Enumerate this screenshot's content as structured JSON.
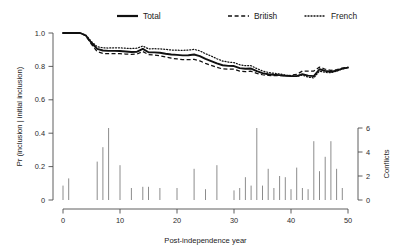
{
  "chart_data": {
    "type": "line",
    "title": "",
    "xlabel": "Post-independence year",
    "ylabel": "Pr (inclusion | initial inclusion)",
    "y2label": "Conflicts",
    "xlim": [
      0,
      50
    ],
    "ylim": [
      0,
      1.0
    ],
    "y2lim": [
      0,
      6
    ],
    "grid": false,
    "legend_position": "top",
    "xticks": [
      "0",
      "10",
      "20",
      "30",
      "40",
      "50"
    ],
    "xtick_values": [
      0,
      10,
      20,
      30,
      40,
      50
    ],
    "yticks": [
      "0",
      "0.2",
      "0.4",
      "0.6",
      "0.8",
      "1.0"
    ],
    "ytick_values": [
      0,
      0.2,
      0.4,
      0.6,
      0.8,
      1.0
    ],
    "y2ticks": [
      "0",
      "2",
      "4",
      "6"
    ],
    "y2tick_values": [
      0,
      2,
      4,
      6
    ],
    "x": [
      0,
      1,
      2,
      3,
      4,
      5,
      6,
      7,
      8,
      9,
      10,
      11,
      12,
      13,
      14,
      15,
      16,
      17,
      18,
      19,
      20,
      21,
      22,
      23,
      24,
      25,
      26,
      27,
      28,
      29,
      30,
      31,
      32,
      33,
      34,
      35,
      36,
      37,
      38,
      39,
      40,
      41,
      42,
      43,
      44,
      45,
      46,
      47,
      48,
      49,
      50
    ],
    "series": [
      {
        "name": "Total",
        "style": "solid",
        "values": [
          1.0,
          1.0,
          1.0,
          1.0,
          0.985,
          0.94,
          0.905,
          0.895,
          0.893,
          0.893,
          0.892,
          0.889,
          0.886,
          0.888,
          0.905,
          0.885,
          0.884,
          0.882,
          0.876,
          0.871,
          0.869,
          0.866,
          0.867,
          0.871,
          0.862,
          0.845,
          0.832,
          0.818,
          0.807,
          0.803,
          0.802,
          0.79,
          0.786,
          0.787,
          0.772,
          0.76,
          0.753,
          0.75,
          0.748,
          0.744,
          0.742,
          0.742,
          0.754,
          0.745,
          0.742,
          0.783,
          0.773,
          0.768,
          0.775,
          0.787,
          0.793
        ]
      },
      {
        "name": "British",
        "style": "dashed",
        "values": [
          1.0,
          1.0,
          1.0,
          1.0,
          0.983,
          0.932,
          0.888,
          0.878,
          0.876,
          0.877,
          0.876,
          0.874,
          0.872,
          0.874,
          0.889,
          0.871,
          0.868,
          0.864,
          0.856,
          0.849,
          0.845,
          0.84,
          0.84,
          0.842,
          0.833,
          0.818,
          0.806,
          0.794,
          0.785,
          0.783,
          0.783,
          0.772,
          0.769,
          0.771,
          0.758,
          0.75,
          0.746,
          0.745,
          0.745,
          0.745,
          0.747,
          0.752,
          0.772,
          0.772,
          0.772,
          0.796,
          0.783,
          0.776,
          0.781,
          0.79,
          0.795
        ]
      },
      {
        "name": "French",
        "style": "dotted",
        "values": [
          1.0,
          1.0,
          1.0,
          1.0,
          0.988,
          0.948,
          0.918,
          0.911,
          0.91,
          0.911,
          0.911,
          0.909,
          0.907,
          0.909,
          0.922,
          0.905,
          0.906,
          0.905,
          0.902,
          0.898,
          0.897,
          0.896,
          0.898,
          0.902,
          0.893,
          0.876,
          0.862,
          0.846,
          0.832,
          0.826,
          0.823,
          0.81,
          0.804,
          0.804,
          0.787,
          0.773,
          0.764,
          0.759,
          0.755,
          0.748,
          0.744,
          0.74,
          0.748,
          0.736,
          0.731,
          0.772,
          0.764,
          0.762,
          0.771,
          0.785,
          0.792
        ]
      }
    ],
    "bars": {
      "name": "Conflicts",
      "values": [
        1.2,
        1.8,
        0,
        0,
        0,
        0,
        3.2,
        4.4,
        6.0,
        0,
        2.9,
        0,
        1.0,
        0,
        1.1,
        1.1,
        0,
        1.0,
        0,
        0,
        1.0,
        0,
        0,
        2.6,
        0,
        0.9,
        0,
        2.9,
        0,
        0,
        0.8,
        1.0,
        1.9,
        1.2,
        6.0,
        1.2,
        2.6,
        1.0,
        2.0,
        1.9,
        0.9,
        2.7,
        1.0,
        0.9,
        4.9,
        2.4,
        3.6,
        4.9,
        2.6,
        1.0,
        0
      ]
    }
  },
  "legend": {
    "items": [
      {
        "label": "Total"
      },
      {
        "label": "British"
      },
      {
        "label": "French"
      }
    ]
  },
  "colors": {
    "line": "#111111",
    "bar": "#8c8c8c",
    "axis": "#4d4d4d",
    "background": "#ffffff"
  }
}
